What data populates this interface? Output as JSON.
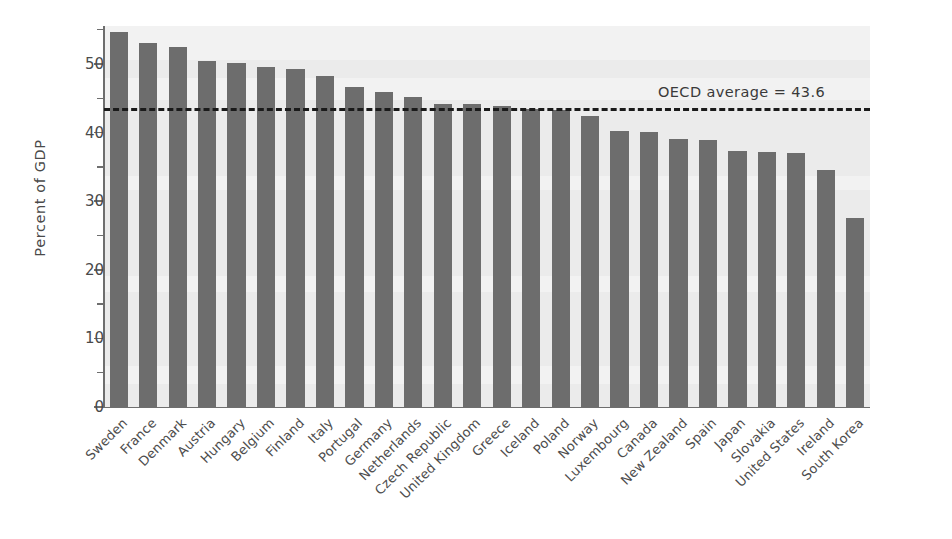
{
  "chart_data": {
    "type": "bar",
    "title": "",
    "xlabel": "",
    "ylabel": "Percent of GDP",
    "ylim": [
      0,
      57
    ],
    "yticks_major": [
      0,
      10,
      20,
      30,
      40,
      50
    ],
    "yticks_minor": [
      5,
      15,
      25,
      35,
      45,
      55
    ],
    "grid": false,
    "legend": "none",
    "bar_color": "#6d6d6d",
    "plot_background": "#ebebeb",
    "categories": [
      "Sweden",
      "France",
      "Denmark",
      "Austria",
      "Hungary",
      "Belgium",
      "Finland",
      "Italy",
      "Portugal",
      "Germany",
      "Netherlands",
      "Czech Republic",
      "United Kingdom",
      "Greece",
      "Iceland",
      "Poland",
      "Norway",
      "Luxembourg",
      "Canada",
      "New Zealand",
      "Spain",
      "Japan",
      "Slovakia",
      "United States",
      "Ireland",
      "South Korea"
    ],
    "values": [
      54.7,
      53.0,
      52.5,
      50.5,
      50.2,
      49.6,
      49.2,
      48.2,
      46.6,
      45.9,
      45.2,
      44.2,
      44.1,
      43.9,
      43.5,
      43.3,
      42.4,
      40.2,
      40.1,
      39.1,
      38.9,
      37.3,
      37.2,
      37.0,
      34.6,
      27.5
    ],
    "annotations": [
      {
        "name": "oecd-average-line",
        "label": "OECD average  =  43.6",
        "value": 43.6,
        "style": "dashed",
        "color": "#1a1a1a"
      }
    ]
  }
}
